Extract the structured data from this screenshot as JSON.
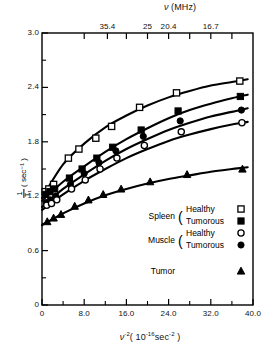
{
  "chart_data": {
    "type": "scatter",
    "title": "",
    "xlabel": "ν⁻² (10⁻¹⁶ sec⁻²)",
    "ylabel": "1/T₁ (sec⁻¹)",
    "top_axis_label": "ν (MHz)",
    "xlim": [
      0,
      40
    ],
    "ylim": [
      0,
      3.0
    ],
    "xticks": [
      0,
      8.0,
      16.0,
      24.0,
      32.0,
      40.0
    ],
    "xtick_labels": [
      "0",
      "8.0",
      "16.0",
      "24.0",
      "32.0",
      "40.0"
    ],
    "xticks_minor": [
      4.0,
      12.0,
      20.0,
      28.0,
      36.0
    ],
    "yticks": [
      0,
      0.6,
      1.2,
      1.8,
      2.4,
      3.0
    ],
    "ytick_labels": [
      "0",
      "0.6",
      "1.2",
      "1.8",
      "2.4",
      "3.0"
    ],
    "yticks_minor": [
      0.3,
      0.9,
      1.5,
      2.1,
      2.7
    ],
    "top_ticks": [
      8.0,
      12.4,
      16.0,
      20.0,
      24.0,
      28.0,
      32.0,
      36.0
    ],
    "top_tick_labels": [
      "",
      "35.4",
      "",
      "25",
      "20.4",
      "",
      "16.7",
      ""
    ],
    "grid": false,
    "legend_position": "inside-bottom-right",
    "series": [
      {
        "name": "Spleen Healthy",
        "marker": "open-square",
        "points": [
          [
            0.6,
            1.25
          ],
          [
            1.3,
            1.28
          ],
          [
            2.2,
            1.33
          ],
          [
            5.0,
            1.62
          ],
          [
            7.0,
            1.72
          ],
          [
            10.2,
            1.84
          ],
          [
            13.2,
            1.97
          ],
          [
            18.5,
            2.18
          ],
          [
            25.5,
            2.34
          ],
          [
            37.5,
            2.47
          ]
        ],
        "fit": [
          [
            0,
            1.18
          ],
          [
            4,
            1.55
          ],
          [
            8,
            1.78
          ],
          [
            12,
            1.96
          ],
          [
            16,
            2.09
          ],
          [
            20,
            2.2
          ],
          [
            24,
            2.29
          ],
          [
            28,
            2.36
          ],
          [
            32,
            2.42
          ],
          [
            36,
            2.46
          ],
          [
            39,
            2.49
          ]
        ]
      },
      {
        "name": "Spleen Tumorous",
        "marker": "filled-square",
        "points": [
          [
            0.7,
            1.22
          ],
          [
            1.5,
            1.25
          ],
          [
            2.4,
            1.28
          ],
          [
            5.2,
            1.4
          ],
          [
            7.6,
            1.5
          ],
          [
            10.4,
            1.62
          ],
          [
            13.4,
            1.74
          ],
          [
            18.8,
            1.93
          ],
          [
            25.8,
            2.14
          ],
          [
            37.6,
            2.3
          ]
        ],
        "fit": [
          [
            0,
            1.15
          ],
          [
            4,
            1.36
          ],
          [
            8,
            1.53
          ],
          [
            12,
            1.69
          ],
          [
            16,
            1.83
          ],
          [
            20,
            1.95
          ],
          [
            24,
            2.06
          ],
          [
            28,
            2.15
          ],
          [
            32,
            2.22
          ],
          [
            36,
            2.28
          ],
          [
            39,
            2.32
          ]
        ]
      },
      {
        "name": "Muscle Tumorous",
        "marker": "filled-circle",
        "points": [
          [
            0.8,
            1.13
          ],
          [
            1.6,
            1.16
          ],
          [
            2.6,
            1.2
          ],
          [
            5.4,
            1.33
          ],
          [
            8.0,
            1.45
          ],
          [
            10.8,
            1.57
          ],
          [
            14.0,
            1.7
          ],
          [
            19.2,
            1.86
          ],
          [
            26.2,
            2.03
          ],
          [
            37.8,
            2.15
          ]
        ],
        "fit": [
          [
            0,
            1.08
          ],
          [
            4,
            1.28
          ],
          [
            8,
            1.44
          ],
          [
            12,
            1.59
          ],
          [
            16,
            1.72
          ],
          [
            20,
            1.83
          ],
          [
            24,
            1.93
          ],
          [
            28,
            2.01
          ],
          [
            32,
            2.08
          ],
          [
            36,
            2.13
          ],
          [
            39,
            2.17
          ]
        ]
      },
      {
        "name": "Muscle Healthy",
        "marker": "open-circle",
        "points": [
          [
            0.9,
            1.1
          ],
          [
            1.8,
            1.12
          ],
          [
            2.8,
            1.16
          ],
          [
            5.6,
            1.28
          ],
          [
            8.2,
            1.38
          ],
          [
            11.0,
            1.5
          ],
          [
            14.2,
            1.62
          ],
          [
            19.4,
            1.76
          ],
          [
            26.4,
            1.91
          ],
          [
            37.9,
            2.01
          ]
        ],
        "fit": [
          [
            0,
            1.05
          ],
          [
            4,
            1.22
          ],
          [
            8,
            1.37
          ],
          [
            12,
            1.5
          ],
          [
            16,
            1.62
          ],
          [
            20,
            1.72
          ],
          [
            24,
            1.81
          ],
          [
            28,
            1.88
          ],
          [
            32,
            1.94
          ],
          [
            36,
            1.99
          ],
          [
            39,
            2.02
          ]
        ]
      },
      {
        "name": "Tumor",
        "marker": "filled-triangle",
        "points": [
          [
            1.0,
            0.92
          ],
          [
            2.2,
            0.96
          ],
          [
            3.6,
            1.0
          ],
          [
            6.2,
            1.09
          ],
          [
            8.8,
            1.16
          ],
          [
            11.6,
            1.22
          ],
          [
            15.0,
            1.28
          ],
          [
            20.5,
            1.36
          ],
          [
            27.5,
            1.44
          ],
          [
            38.0,
            1.5
          ]
        ],
        "fit": [
          [
            0,
            0.88
          ],
          [
            4,
            1.01
          ],
          [
            8,
            1.12
          ],
          [
            12,
            1.21
          ],
          [
            16,
            1.28
          ],
          [
            20,
            1.34
          ],
          [
            24,
            1.39
          ],
          [
            28,
            1.43
          ],
          [
            32,
            1.47
          ],
          [
            36,
            1.5
          ],
          [
            39,
            1.52
          ]
        ]
      }
    ]
  },
  "legend": {
    "rows": [
      {
        "group": "Spleen",
        "paren": "(",
        "sub": [
          "Healthy",
          "Tumorous"
        ],
        "markers": [
          "open-square",
          "filled-square"
        ]
      },
      {
        "group": "Muscle",
        "paren": "(",
        "sub": [
          "Healthy",
          "Tumorous"
        ],
        "markers": [
          "open-circle",
          "filled-circle"
        ]
      },
      {
        "group": "Tumor",
        "paren": "",
        "sub": [
          ""
        ],
        "markers": [
          "filled-triangle"
        ]
      }
    ]
  },
  "axes": {
    "y_numerator": "1",
    "y_denominator": "T₁",
    "y_units": "( sec⁻¹ )",
    "x_title_main": "ν",
    "x_title_exp": "-2",
    "x_title_rest": "( 10",
    "x_title_rest_exp": "-16",
    "x_title_rest2": "sec",
    "x_title_rest2_exp": "-2",
    "x_title_close": " )",
    "top_title_main": "ν",
    "top_title_units": "(MHz)"
  }
}
